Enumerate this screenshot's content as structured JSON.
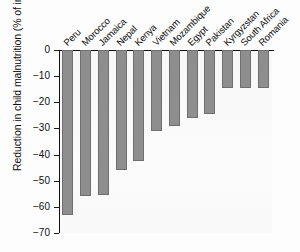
{
  "chart_data": {
    "type": "bar",
    "title": "",
    "xlabel": "",
    "ylabel": "Reduction in child malnutrition (% of initial value)",
    "categories": [
      "Peru",
      "Morocco",
      "Jamaica",
      "Nepal",
      "Kenya",
      "Vietnam",
      "Mozambique",
      "Egypt",
      "Pakistan",
      "Kyrgyzstan",
      "South Africa",
      "Romania"
    ],
    "values": [
      -63,
      -56,
      -55.5,
      -46,
      -42.5,
      -31,
      -29,
      -26,
      -24.5,
      -14.5,
      -14.5,
      -14.5
    ],
    "ylim": [
      -70,
      0
    ],
    "yticks": [
      0,
      -10,
      -20,
      -30,
      -40,
      -50,
      -60,
      -70
    ],
    "ytick_labels": [
      "0",
      "−10",
      "−20",
      "−30",
      "−40",
      "−50",
      "−60",
      "−70"
    ],
    "grid": false,
    "legend": null,
    "bar_color": "#8e8e8e",
    "bar_edge_color": "#6f6f6f",
    "axis_color": "#111111",
    "background_color": "#fafafa"
  }
}
